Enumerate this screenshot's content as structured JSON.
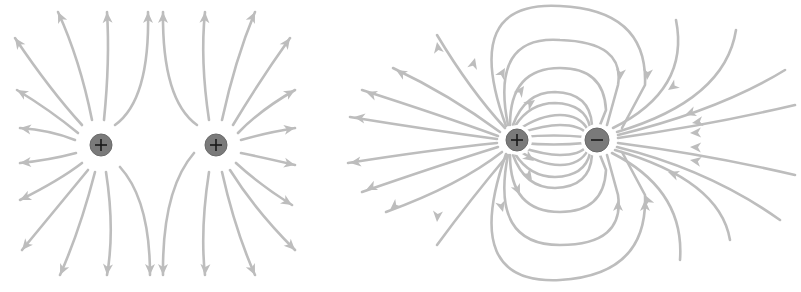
{
  "diagram": {
    "type": "electric-field-lines",
    "colors": {
      "field_line": "#bdbdbd",
      "arrow": "#bdbdbd",
      "charge": "#7a7a7a",
      "sign": "#1a1a1a",
      "background": "#ffffff"
    },
    "panels": [
      {
        "name": "two-positive-charges",
        "charges": [
          {
            "sign": "+",
            "x": 101,
            "y": 145,
            "r": 11
          },
          {
            "sign": "+",
            "x": 216,
            "y": 145,
            "r": 11
          }
        ],
        "lines": [
          "M 82 125 Q 50 90 15 38",
          "M 92 120 Q 80 60 58 12",
          "M 104 120 Q 110 60 107 12",
          "M 115 125 Q 150 100 148 12",
          "M 78 133 Q 50 110 17 90",
          "M 75 140 Q 50 130 20 128",
          "M 76 153 Q 50 160 20 163",
          "M 82 163 Q 60 180 20 200",
          "M 88 170 Q 55 210 22 250",
          "M 95 172 Q 80 230 60 275",
          "M 106 172 Q 115 230 107 275",
          "M 120 167 Q 150 200 150 275",
          "M 197 125 Q 162 100 163 12",
          "M 209 120 Q 200 60 205 12",
          "M 222 120 Q 235 60 255 12",
          "M 233 125 Q 260 80 290 38",
          "M 238 133 Q 260 110 295 90",
          "M 241 140 Q 265 133 295 128",
          "M 241 153 Q 265 158 295 165",
          "M 236 163 Q 260 185 292 205",
          "M 230 170 Q 255 210 295 250",
          "M 222 172 Q 235 230 255 275",
          "M 209 172 Q 200 230 205 275",
          "M 194 153 Q 162 190 163 275"
        ],
        "arrows": [
          {
            "x": 15,
            "y": 38,
            "angle": -125
          },
          {
            "x": 58,
            "y": 12,
            "angle": -115
          },
          {
            "x": 107,
            "y": 12,
            "angle": -93
          },
          {
            "x": 148,
            "y": 12,
            "angle": -90
          },
          {
            "x": 17,
            "y": 90,
            "angle": -150
          },
          {
            "x": 20,
            "y": 128,
            "angle": -172
          },
          {
            "x": 20,
            "y": 163,
            "angle": 175
          },
          {
            "x": 20,
            "y": 200,
            "angle": 155
          },
          {
            "x": 22,
            "y": 250,
            "angle": 130
          },
          {
            "x": 60,
            "y": 275,
            "angle": 115
          },
          {
            "x": 107,
            "y": 275,
            "angle": 95
          },
          {
            "x": 150,
            "y": 275,
            "angle": 90
          },
          {
            "x": 163,
            "y": 12,
            "angle": -90
          },
          {
            "x": 205,
            "y": 12,
            "angle": -87
          },
          {
            "x": 255,
            "y": 12,
            "angle": -65
          },
          {
            "x": 290,
            "y": 38,
            "angle": -55
          },
          {
            "x": 295,
            "y": 90,
            "angle": -30
          },
          {
            "x": 295,
            "y": 128,
            "angle": -10
          },
          {
            "x": 295,
            "y": 165,
            "angle": 12
          },
          {
            "x": 292,
            "y": 205,
            "angle": 32
          },
          {
            "x": 295,
            "y": 250,
            "angle": 45
          },
          {
            "x": 255,
            "y": 275,
            "angle": 65
          },
          {
            "x": 205,
            "y": 275,
            "angle": 92
          },
          {
            "x": 163,
            "y": 275,
            "angle": 90
          }
        ]
      },
      {
        "name": "positive-negative-dipole",
        "charges": [
          {
            "sign": "+",
            "x": 517,
            "y": 140,
            "r": 11
          },
          {
            "sign": "-",
            "x": 597,
            "y": 140,
            "r": 12
          }
        ],
        "lines": [
          "M 505 128 Q 470 90 437 35",
          "M 500 132 Q 450 95 393 68",
          "M 498 136 Q 440 115 362 90",
          "M 497 139 Q 430 130 350 117",
          "M 497 143 Q 430 150 348 163",
          "M 498 147 Q 440 165 362 192",
          "M 502 152 Q 460 185 386 212",
          "M 507 156 Q 470 200 437 245",
          "M 506 126 Q 460 0 560 6 Q 648 10 645 85 L 622 128",
          "M 508 125 Q 490 35 560 40 Q 625 42 618 85 L 607 125",
          "M 510 125 Q 510 68 560 68 Q 604 68 606 110 L 600 125",
          "M 513 125 Q 525 92 555 92 Q 590 93 592 125",
          "M 515 126 Q 530 103 555 103 Q 585 104 590 127",
          "M 518 130 Q 540 115 560 115 Q 580 115 588 130",
          "M 520 133 Q 545 125 560 125 Q 580 125 587 134",
          "M 521 137 Q 555 134 585 137",
          "M 521 143 Q 555 146 585 143",
          "M 520 147 Q 545 155 560 155 Q 580 155 587 146",
          "M 518 150 Q 540 165 560 165 Q 580 165 588 150",
          "M 515 154 Q 530 177 555 177 Q 585 176 590 153",
          "M 513 155 Q 525 188 555 188 Q 590 187 592 155",
          "M 510 155 Q 510 212 560 212 Q 604 212 606 170 L 600 155",
          "M 508 155 Q 490 245 560 245 Q 625 245 618 195 L 607 155",
          "M 506 154 Q 460 285 560 280 Q 648 275 645 195 L 622 152",
          "M 676 20 Q 690 90 613 128",
          "M 736 30 Q 725 100 617 132",
          "M 785 70 Q 720 110 618 135",
          "M 795 105 Q 710 125 618 138",
          "M 795 175 Q 710 155 618 143",
          "M 780 220 Q 710 170 617 147",
          "M 730 240 Q 720 180 615 150",
          "M 680 260 Q 685 190 612 153"
        ],
        "arrows": [
          {
            "x": 437,
            "y": 42,
            "angle": -100
          },
          {
            "x": 396,
            "y": 70,
            "angle": -150
          },
          {
            "x": 366,
            "y": 92,
            "angle": -160
          },
          {
            "x": 354,
            "y": 117,
            "angle": -172
          },
          {
            "x": 350,
            "y": 163,
            "angle": 172
          },
          {
            "x": 366,
            "y": 190,
            "angle": 155
          },
          {
            "x": 390,
            "y": 210,
            "angle": 140
          },
          {
            "x": 437,
            "y": 222,
            "angle": 95
          },
          {
            "x": 475,
            "y": 58,
            "angle": -75
          },
          {
            "x": 505,
            "y": 68,
            "angle": -60
          },
          {
            "x": 524,
            "y": 86,
            "angle": -55
          },
          {
            "x": 535,
            "y": 100,
            "angle": -35
          },
          {
            "x": 647,
            "y": 80,
            "angle": 95
          },
          {
            "x": 620,
            "y": 80,
            "angle": 95
          },
          {
            "x": 534,
            "y": 161,
            "angle": 35
          },
          {
            "x": 532,
            "y": 180,
            "angle": 55
          },
          {
            "x": 520,
            "y": 195,
            "angle": 65
          },
          {
            "x": 503,
            "y": 212,
            "angle": 75
          },
          {
            "x": 618,
            "y": 200,
            "angle": -90
          },
          {
            "x": 645,
            "y": 200,
            "angle": -90
          },
          {
            "x": 668,
            "y": 90,
            "angle": 145
          },
          {
            "x": 685,
            "y": 115,
            "angle": 160
          },
          {
            "x": 692,
            "y": 123,
            "angle": 170
          },
          {
            "x": 690,
            "y": 133,
            "angle": 178
          },
          {
            "x": 690,
            "y": 147,
            "angle": -178
          },
          {
            "x": 690,
            "y": 160,
            "angle": -170
          },
          {
            "x": 668,
            "y": 172,
            "angle": -160
          },
          {
            "x": 645,
            "y": 195,
            "angle": -115
          }
        ]
      }
    ]
  }
}
